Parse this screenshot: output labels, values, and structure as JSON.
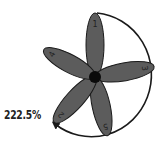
{
  "diagram": {
    "rotation_label": "222.5%",
    "rotation_direction": "clockwise",
    "petals": [
      {
        "label": "1",
        "angle_deg": 0
      },
      {
        "label": "3",
        "angle_deg": 80
      },
      {
        "label": "5",
        "angle_deg": 165
      },
      {
        "label": "2",
        "angle_deg": 220
      },
      {
        "label": "4",
        "angle_deg": 300
      }
    ],
    "colors": {
      "petal_fill": "#5c5c5c",
      "petal_stroke": "#1a1a1a",
      "center": "#0a0a0a",
      "arc": "#1a1a1a",
      "label": "#222222"
    }
  }
}
